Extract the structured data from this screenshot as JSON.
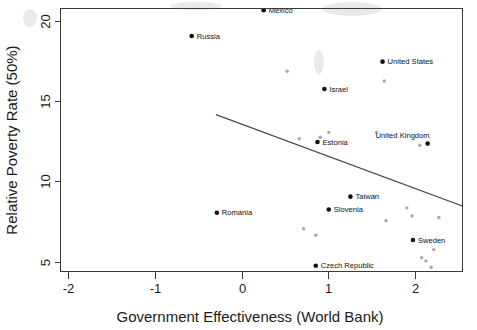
{
  "chart_data": {
    "type": "scatter",
    "title": "",
    "xlabel": "Government Effectiveness (World Bank)",
    "ylabel": "Relative Poverty Rate (50%)",
    "xlim": [
      -2.35,
      2.55
    ],
    "ylim": [
      4.3,
      20.9
    ],
    "xticks": [
      -2,
      -1,
      0,
      1,
      2
    ],
    "xtick_labels": [
      "-2",
      "-1",
      "0",
      "1",
      "2"
    ],
    "yticks": [
      5,
      10,
      15,
      20
    ],
    "ytick_labels": [
      "5",
      "10",
      "15",
      "20"
    ],
    "grid": false,
    "legend": "none",
    "series": [
      {
        "name": "Labeled countries",
        "marker": "filled-circle-dark",
        "color": "#111111",
        "points": [
          {
            "label": "Mexico",
            "x": 0.25,
            "y": 20.7,
            "label_pos": "right"
          },
          {
            "label": "Russia",
            "x": -0.58,
            "y": 19.1,
            "label_pos": "right"
          },
          {
            "label": "United States",
            "x": 1.62,
            "y": 17.5,
            "label_pos": "right"
          },
          {
            "label": "Israel",
            "x": 0.95,
            "y": 15.8,
            "label_pos": "right"
          },
          {
            "label": "Estonia",
            "x": 0.87,
            "y": 12.5,
            "label_pos": "right"
          },
          {
            "label": "United Kingdom",
            "x": 2.14,
            "y": 12.4,
            "label_pos": "above"
          },
          {
            "label": "Taiwan",
            "x": 1.25,
            "y": 9.1,
            "label_pos": "right"
          },
          {
            "label": "Slovenia",
            "x": 1.0,
            "y": 8.3,
            "label_pos": "right"
          },
          {
            "label": "Romania",
            "x": -0.29,
            "y": 8.1,
            "label_pos": "right"
          },
          {
            "label": "Sweden",
            "x": 1.97,
            "y": 6.4,
            "label_pos": "right"
          },
          {
            "label": "Czech Republic",
            "x": 0.85,
            "y": 4.8,
            "label_pos": "right"
          }
        ]
      },
      {
        "name": "Unlabeled countries",
        "marker": "small-circle-gray",
        "color": "#a8a8a8",
        "points": [
          {
            "x": 0.52,
            "y": 16.9
          },
          {
            "x": 1.64,
            "y": 16.3
          },
          {
            "x": 1.0,
            "y": 13.1
          },
          {
            "x": 1.55,
            "y": 13.1
          },
          {
            "x": 0.66,
            "y": 12.7
          },
          {
            "x": 0.9,
            "y": 12.8
          },
          {
            "x": 2.05,
            "y": 12.3
          },
          {
            "x": 1.9,
            "y": 8.4
          },
          {
            "x": 1.96,
            "y": 7.9
          },
          {
            "x": 2.27,
            "y": 7.8
          },
          {
            "x": 1.66,
            "y": 7.6
          },
          {
            "x": 0.71,
            "y": 7.1
          },
          {
            "x": 0.85,
            "y": 6.7
          },
          {
            "x": 2.21,
            "y": 5.8
          },
          {
            "x": 2.07,
            "y": 5.3
          },
          {
            "x": 2.12,
            "y": 5.1
          },
          {
            "x": 2.18,
            "y": 4.7
          }
        ]
      }
    ],
    "trend_line": {
      "name": "fitted regression line",
      "x_start": -0.3,
      "y_start": 14.2,
      "x_end": 2.55,
      "y_end": 8.5,
      "color": "#4a4a4a"
    }
  },
  "axes": {
    "x_title": "Government Effectiveness (World Bank)",
    "y_title": "Relative Poverty Rate (50%)"
  }
}
